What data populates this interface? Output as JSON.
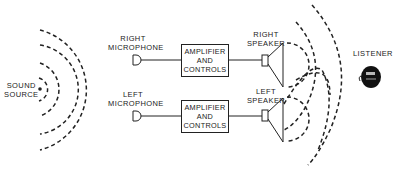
{
  "diagram": {
    "sound_source": {
      "label_line1": "SOUND",
      "label_line2": "SOURCE"
    },
    "right_channel": {
      "microphone": {
        "label_line1": "RIGHT",
        "label_line2": "MICROPHONE"
      },
      "amplifier": {
        "line1": "AMPLIFIER",
        "line2": "AND",
        "line3": "CONTROLS"
      },
      "speaker": {
        "label_line1": "RIGHT",
        "label_line2": "SPEAKER"
      }
    },
    "left_channel": {
      "microphone": {
        "label_line1": "LEFT",
        "label_line2": "MICROPHONE"
      },
      "amplifier": {
        "line1": "AMPLIFIER",
        "line2": "AND",
        "line3": "CONTROLS"
      },
      "speaker": {
        "label_line1": "LEFT",
        "label_line2": "SPEAKER"
      }
    },
    "listener": {
      "label": "LISTENER"
    },
    "colors": {
      "line": "#222222",
      "background": "#ffffff"
    }
  }
}
